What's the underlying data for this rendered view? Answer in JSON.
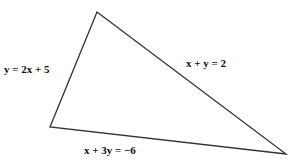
{
  "diagram": {
    "type": "triangle",
    "vertices": {
      "top": [
        97,
        12
      ],
      "left": [
        50,
        127
      ],
      "right": [
        286,
        154
      ]
    },
    "line_color": "#333333",
    "labels": [
      {
        "id": "left-side",
        "text": "y = 2x + 5",
        "x": 4,
        "y": 73
      },
      {
        "id": "right-side",
        "text": "x + y = 2",
        "x": 186,
        "y": 67
      },
      {
        "id": "bottom-side",
        "text": "x + 3y = −6",
        "x": 84,
        "y": 154
      }
    ]
  }
}
